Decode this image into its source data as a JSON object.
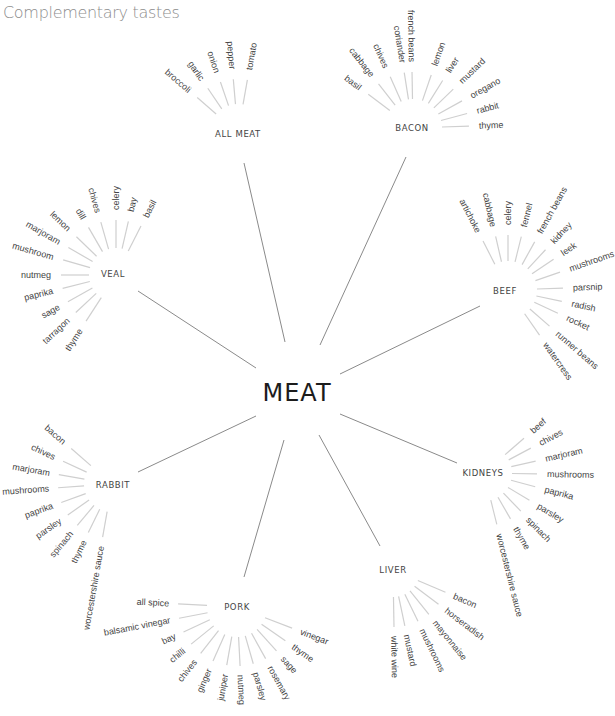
{
  "title": "Complementary tastes",
  "center": {
    "label": "MEAT",
    "x": 297,
    "y": 393
  },
  "colors": {
    "link": "#8a8a8a",
    "spoke": "#cfcfcf",
    "text": "#444444",
    "title": "#8c8c8c"
  },
  "clusters": [
    {
      "name": "ALL MEAT",
      "hub": [
        238,
        133
      ],
      "label_pos": [
        238,
        134
      ],
      "radii": [
        29,
        54,
        64
      ],
      "link": [
        244,
        163,
        285,
        342
      ],
      "items": [
        {
          "label": "broccoli",
          "angle": -139
        },
        {
          "label": "garlic",
          "angle": -124
        },
        {
          "label": "onion",
          "angle": -109
        },
        {
          "label": "pepper",
          "angle": -95
        },
        {
          "label": "tomato",
          "angle": -80
        }
      ]
    },
    {
      "name": "BACON",
      "hub": [
        413,
        128
      ],
      "label_pos": [
        412,
        128
      ],
      "radii": [
        29,
        56,
        66
      ],
      "link": [
        406,
        157,
        320,
        345
      ],
      "items": [
        {
          "label": "basil",
          "angle": -143
        },
        {
          "label": "cabbage",
          "angle": -128
        },
        {
          "label": "chives",
          "angle": -114
        },
        {
          "label": "coriander",
          "angle": -99
        },
        {
          "label": "french beans",
          "angle": -91
        },
        {
          "label": "lemon",
          "angle": -71
        },
        {
          "label": "liver",
          "angle": -58
        },
        {
          "label": "mustard",
          "angle": -44
        },
        {
          "label": "oregano",
          "angle": -29
        },
        {
          "label": "rabbit",
          "angle": -15
        },
        {
          "label": "thyme",
          "angle": -2
        }
      ]
    },
    {
      "name": "VEAL",
      "hub": [
        116,
        275
      ],
      "label_pos": [
        113,
        274
      ],
      "radii": [
        27,
        55,
        65
      ],
      "link": [
        138,
        291,
        256,
        368
      ],
      "items": [
        {
          "label": "basil",
          "angle": -63
        },
        {
          "label": "bay",
          "angle": -77
        },
        {
          "label": "celery",
          "angle": -90
        },
        {
          "label": "chives",
          "angle": -106
        },
        {
          "label": "dill",
          "angle": -120
        },
        {
          "label": "lemon",
          "angle": -136
        },
        {
          "label": "marjoram",
          "angle": -150
        },
        {
          "label": "mushroom",
          "angle": -164
        },
        {
          "label": "nutmeg",
          "angle": 180
        },
        {
          "label": "paprika",
          "angle": 166
        },
        {
          "label": "sage",
          "angle": 151
        },
        {
          "label": "tarragon",
          "angle": 137
        },
        {
          "label": "thyme",
          "angle": 123
        }
      ]
    },
    {
      "name": "BEEF",
      "hub": [
        508,
        290
      ],
      "label_pos": [
        505,
        291
      ],
      "radii": [
        29,
        55,
        65
      ],
      "link": [
        480,
        306,
        340,
        374
      ],
      "items": [
        {
          "label": "artichoke",
          "angle": -117
        },
        {
          "label": "cabbage",
          "angle": -103
        },
        {
          "label": "celery",
          "angle": -90
        },
        {
          "label": "fennel",
          "angle": -76
        },
        {
          "label": "french beans",
          "angle": -61
        },
        {
          "label": "kidney",
          "angle": -47
        },
        {
          "label": "leek",
          "angle": -34
        },
        {
          "label": "mushrooms",
          "angle": -19
        },
        {
          "label": "parsnip",
          "angle": -2
        },
        {
          "label": "radish",
          "angle": 12
        },
        {
          "label": "rocket",
          "angle": 25
        },
        {
          "label": "runner beans",
          "angle": 41
        },
        {
          "label": "watercress",
          "angle": 55
        }
      ]
    },
    {
      "name": "RABBIT",
      "hub": [
        112,
        484
      ],
      "label_pos": [
        113,
        485
      ],
      "radii": [
        28,
        54,
        63
      ],
      "link": [
        138,
        472,
        256,
        416
      ],
      "items": [
        {
          "label": "bacon",
          "angle": -139
        },
        {
          "label": "chives",
          "angle": -155
        },
        {
          "label": "marjoram",
          "angle": -170
        },
        {
          "label": "mushrooms",
          "angle": 176
        },
        {
          "label": "paprika",
          "angle": 160
        },
        {
          "label": "parsley",
          "angle": 145
        },
        {
          "label": "spinach",
          "angle": 130
        },
        {
          "label": "thyme",
          "angle": 116
        },
        {
          "label": "worcestershire sauce",
          "angle": 100
        }
      ]
    },
    {
      "name": "KIDNEYS",
      "hub": [
        484,
        473
      ],
      "label_pos": [
        483,
        473
      ],
      "radii": [
        28,
        53,
        63
      ],
      "link": [
        457,
        463,
        340,
        414
      ],
      "items": [
        {
          "label": "beef",
          "angle": -41
        },
        {
          "label": "chives",
          "angle": -28
        },
        {
          "label": "marjoram",
          "angle": -13
        },
        {
          "label": "mushrooms",
          "angle": 1
        },
        {
          "label": "paprika",
          "angle": 15
        },
        {
          "label": "parsley",
          "angle": 31
        },
        {
          "label": "spinach",
          "angle": 46
        },
        {
          "label": "thyme",
          "angle": 60
        },
        {
          "label": "worcestershire sauce",
          "angle": 76
        }
      ]
    },
    {
      "name": "PORK",
      "hub": [
        237,
        607
      ],
      "label_pos": [
        237,
        607
      ],
      "radii": [
        30,
        59,
        68
      ],
      "link": [
        244,
        577,
        284,
        440
      ],
      "items": [
        {
          "label": "all spice",
          "angle": -177
        },
        {
          "label": "balsamic vinegar",
          "angle": 169
        },
        {
          "label": "bay",
          "angle": 155
        },
        {
          "label": "chilli",
          "angle": 141
        },
        {
          "label": "chives",
          "angle": 128
        },
        {
          "label": "ginger",
          "angle": 114
        },
        {
          "label": "juniper",
          "angle": 100
        },
        {
          "label": "nutmeg",
          "angle": 87
        },
        {
          "label": "parsley",
          "angle": 74
        },
        {
          "label": "rosemary",
          "angle": 61
        },
        {
          "label": "sage",
          "angle": 48
        },
        {
          "label": "thyme",
          "angle": 35
        },
        {
          "label": "vinegar",
          "angle": 21
        }
      ]
    },
    {
      "name": "LIVER",
      "hub": [
        393,
        570
      ],
      "label_pos": [
        393,
        570
      ],
      "radii": [
        27,
        57,
        66
      ],
      "link": [
        380,
        546,
        319,
        435
      ],
      "items": [
        {
          "label": "bacon",
          "angle": 23
        },
        {
          "label": "horseradish",
          "angle": 37
        },
        {
          "label": "mayonnaise",
          "angle": 51
        },
        {
          "label": "mushrooms",
          "angle": 64
        },
        {
          "label": "mustard",
          "angle": 78
        },
        {
          "label": "white wine",
          "angle": 89
        }
      ]
    }
  ]
}
